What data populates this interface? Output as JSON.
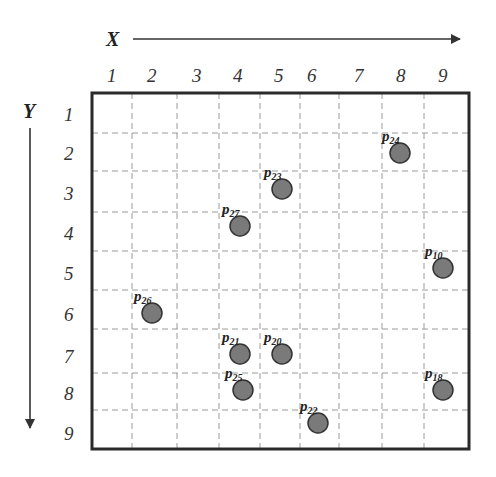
{
  "diagram": {
    "x_axis": {
      "label": "X",
      "ticks": [
        "1",
        "2",
        "3",
        "4",
        "5",
        "6",
        "7",
        "8",
        "9"
      ]
    },
    "y_axis": {
      "label": "Y",
      "ticks": [
        "1",
        "2",
        "3",
        "4",
        "5",
        "6",
        "7",
        "8",
        "9"
      ]
    },
    "points": [
      {
        "label": "p",
        "sub": "24",
        "px": 400,
        "py": 153
      },
      {
        "label": "p",
        "sub": "23",
        "px": 282,
        "py": 189
      },
      {
        "label": "p",
        "sub": "27",
        "px": 240,
        "py": 226
      },
      {
        "label": "p",
        "sub": "10",
        "px": 443,
        "py": 268
      },
      {
        "label": "p",
        "sub": "26",
        "px": 152,
        "py": 313
      },
      {
        "label": "p",
        "sub": "21",
        "px": 240,
        "py": 354
      },
      {
        "label": "p",
        "sub": "20",
        "px": 282,
        "py": 354
      },
      {
        "label": "p",
        "sub": "25",
        "px": 243,
        "py": 390
      },
      {
        "label": "p",
        "sub": "18",
        "px": 443,
        "py": 390
      },
      {
        "label": "p",
        "sub": "22",
        "px": 318,
        "py": 423
      }
    ],
    "colors": {
      "point_fill": "#7a7a7a",
      "point_stroke": "#333333",
      "grid": "#9a9a9a",
      "frame": "#2a2a2a"
    }
  }
}
